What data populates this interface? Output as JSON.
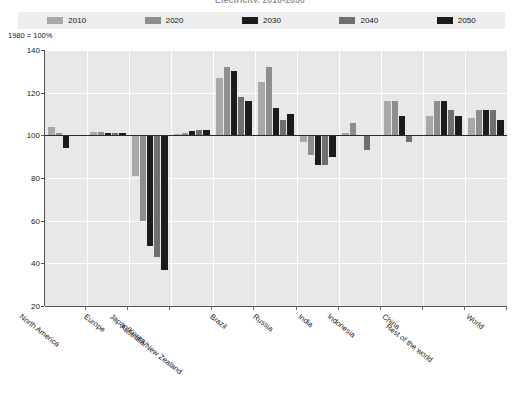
{
  "chart_title": "Electricity, 2010-2050",
  "axis_note": "1980 = 100%",
  "legend": {
    "position": "top",
    "items": [
      {
        "label": "2010",
        "color": "#a8a8a8"
      },
      {
        "label": "2020",
        "color": "#8e8e8e"
      },
      {
        "label": "2030",
        "color": "#1c1c1c"
      },
      {
        "label": "2040",
        "color": "#6f6f6f"
      },
      {
        "label": "2050",
        "color": "#1c1c1c"
      }
    ]
  },
  "yaxis": {
    "ticks": [
      140,
      120,
      100,
      80,
      60,
      40,
      20
    ],
    "min": 20,
    "max": 140,
    "baseline": 100
  },
  "footnote": "",
  "chart_data": {
    "type": "bar",
    "title": "Electricity, 2010-2050",
    "xlabel": "",
    "ylabel": "1980 = 100%",
    "ylim": [
      20,
      140
    ],
    "grid": true,
    "legend_position": "top",
    "baseline": 100,
    "categories": [
      "North America",
      "Europe",
      "Japan/Korea",
      "Australia/New Zealand",
      "Brazil",
      "Russia",
      "India",
      "Indonesia",
      "China",
      "Rest of the world",
      "World"
    ],
    "series": [
      {
        "name": "2010",
        "color": "#a8a8a8",
        "values": [
          104,
          101.5,
          81,
          100.5,
          127,
          125,
          97,
          101,
          116,
          109,
          108
        ]
      },
      {
        "name": "2020",
        "color": "#8e8e8e",
        "values": [
          101,
          101.5,
          60,
          101,
          132,
          132,
          91,
          106,
          116,
          116,
          112
        ]
      },
      {
        "name": "2030",
        "color": "#1c1c1c",
        "values": [
          94,
          101,
          48,
          102,
          130,
          113,
          86,
          100,
          109,
          116,
          112
        ]
      },
      {
        "name": "2040",
        "color": "#6f6f6f",
        "values": [
          100,
          101,
          43,
          102.5,
          118,
          107,
          86,
          93,
          97,
          112,
          112
        ]
      },
      {
        "name": "2050",
        "color": "#1c1c1c",
        "values": [
          100,
          101,
          37,
          102.5,
          116,
          110,
          90,
          100,
          100,
          109,
          107
        ]
      }
    ]
  }
}
